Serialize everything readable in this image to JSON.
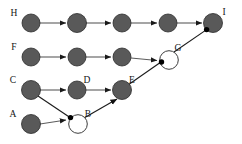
{
  "diagram": {
    "type": "node-link-diagram",
    "canvas": {
      "width": 242,
      "height": 144,
      "background": "#ffffff"
    },
    "style": {
      "filled_node_fill": "#595959",
      "filled_node_stroke": "#2b2b2b",
      "hollow_node_fill": "#ffffff",
      "hollow_node_stroke": "#3d3d3d",
      "edge_color": "#5c5c5c",
      "diagonal_edge_color": "#1c1c1c",
      "merge_dot_color": "#000000",
      "label_color": "#141414",
      "node_radius": 9,
      "hollow_node_radius": 9,
      "merge_dot_radius": 2.6
    },
    "rows": [
      {
        "id": "row-h",
        "label": "H",
        "y": 23
      },
      {
        "id": "row-f",
        "label": "F",
        "y": 57
      },
      {
        "id": "row-c",
        "label": "C",
        "y": 90
      },
      {
        "id": "row-a",
        "label": "A",
        "y": 124
      }
    ],
    "columns": [
      31,
      77,
      122,
      168,
      213
    ],
    "nodes": [
      {
        "id": "H",
        "label": "H",
        "x": 31,
        "y": 23,
        "fill": "filled",
        "label_pos": "left"
      },
      {
        "id": "h2",
        "label": "",
        "x": 77,
        "y": 23,
        "fill": "filled",
        "label_pos": "none"
      },
      {
        "id": "h3",
        "label": "",
        "x": 122,
        "y": 23,
        "fill": "filled",
        "label_pos": "none"
      },
      {
        "id": "h4",
        "label": "",
        "x": 168,
        "y": 23,
        "fill": "filled",
        "label_pos": "none"
      },
      {
        "id": "I",
        "label": "I",
        "x": 213,
        "y": 23,
        "fill": "filled",
        "label_pos": "top-right"
      },
      {
        "id": "F",
        "label": "F",
        "x": 31,
        "y": 57,
        "fill": "filled",
        "label_pos": "left"
      },
      {
        "id": "f2",
        "label": "",
        "x": 77,
        "y": 57,
        "fill": "filled",
        "label_pos": "none"
      },
      {
        "id": "f3",
        "label": "",
        "x": 122,
        "y": 57,
        "fill": "filled",
        "label_pos": "none"
      },
      {
        "id": "G",
        "label": "G",
        "x": 168,
        "y": 57,
        "fill": "hollow",
        "label_pos": "top-right"
      },
      {
        "id": "C",
        "label": "C",
        "x": 31,
        "y": 90,
        "fill": "filled",
        "label_pos": "left"
      },
      {
        "id": "D",
        "label": "D",
        "x": 77,
        "y": 90,
        "fill": "filled",
        "label_pos": "top-right"
      },
      {
        "id": "E",
        "label": "E",
        "x": 122,
        "y": 90,
        "fill": "filled",
        "label_pos": "top-right"
      },
      {
        "id": "A",
        "label": "A",
        "x": 31,
        "y": 124,
        "fill": "filled",
        "label_pos": "left"
      },
      {
        "id": "B",
        "label": "B",
        "x": 77,
        "y": 124,
        "fill": "hollow",
        "label_pos": "top-right"
      }
    ],
    "edges": [
      {
        "from": "H",
        "to": "h2",
        "kind": "horizontal"
      },
      {
        "from": "h2",
        "to": "h3",
        "kind": "horizontal"
      },
      {
        "from": "h3",
        "to": "h4",
        "kind": "horizontal"
      },
      {
        "from": "h4",
        "to": "I",
        "kind": "horizontal"
      },
      {
        "from": "F",
        "to": "f2",
        "kind": "horizontal"
      },
      {
        "from": "f2",
        "to": "f3",
        "kind": "horizontal"
      },
      {
        "from": "f3",
        "to": "G",
        "kind": "horizontal"
      },
      {
        "from": "C",
        "to": "D",
        "kind": "horizontal"
      },
      {
        "from": "D",
        "to": "E",
        "kind": "horizontal"
      },
      {
        "from": "A",
        "to": "B",
        "kind": "horizontal"
      },
      {
        "from": "C",
        "to": "B",
        "kind": "diagonal"
      },
      {
        "from": "B",
        "to": "E",
        "kind": "diagonal"
      },
      {
        "from": "E",
        "to": "G",
        "kind": "diagonal"
      },
      {
        "from": "G",
        "to": "I",
        "kind": "diagonal"
      }
    ],
    "merge_dots": [
      {
        "on": "B",
        "x": 70.0,
        "y": 117.6
      },
      {
        "on": "G",
        "x": 161.0,
        "y": 62.0
      },
      {
        "on": "I",
        "x": 206.6,
        "y": 29.6
      }
    ],
    "row_labels": [
      {
        "text": "H",
        "x": 14,
        "y": 16
      },
      {
        "text": "F",
        "x": 14,
        "y": 50
      },
      {
        "text": "C",
        "x": 13,
        "y": 83
      },
      {
        "text": "A",
        "x": 13,
        "y": 117
      }
    ],
    "node_labels": [
      {
        "text": "I",
        "x": 222,
        "y": 16
      },
      {
        "text": "G",
        "x": 177,
        "y": 50
      },
      {
        "text": "D",
        "x": 86,
        "y": 83
      },
      {
        "text": "E",
        "x": 131,
        "y": 83
      },
      {
        "text": "B",
        "x": 86,
        "y": 117
      }
    ]
  }
}
